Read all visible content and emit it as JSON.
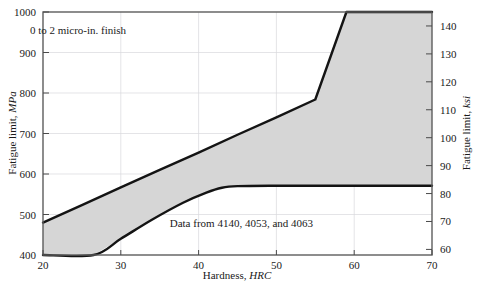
{
  "chart_data": {
    "type": "area",
    "title": "",
    "xlabel_prefix": "Hardness, ",
    "xlabel_unit": "HRC",
    "ylabel_prefix": "Fatigue limit, ",
    "ylabel_unit": "MPa",
    "ylabel_right_prefix": "Fatigue limit, ",
    "ylabel_right_unit": "ksi",
    "xlim": [
      20,
      70
    ],
    "ylim": [
      400,
      1000
    ],
    "ylim_right": [
      58,
      145
    ],
    "xticks": [
      20,
      30,
      40,
      50,
      60,
      70
    ],
    "yticks": [
      400,
      500,
      600,
      700,
      800,
      900,
      1000
    ],
    "yticks_right": [
      60,
      70,
      80,
      90,
      100,
      110,
      120,
      130,
      140
    ],
    "grid": true,
    "legend": "none",
    "band_color": "#d6d6d6",
    "edge_color": "#141414",
    "series": [
      {
        "name": "upper-bound",
        "description": "Upper bound of fatigue limit scatter band, linear rise clipped at 1000 MPa",
        "x": [
          20,
          25,
          30,
          35,
          40,
          45,
          50,
          55,
          59,
          65,
          70
        ],
        "values": [
          480,
          523,
          567,
          610,
          653,
          697,
          740,
          784,
          1000,
          1000,
          1000
        ]
      },
      {
        "name": "lower-bound",
        "description": "Lower bound of fatigue limit scatter band, rises then plateaus near 570 MPa",
        "x": [
          20,
          26.5,
          30,
          34,
          38,
          41,
          43,
          45,
          50,
          55,
          60,
          65,
          70
        ],
        "values": [
          400,
          400,
          440,
          487,
          529,
          554,
          566,
          570,
          571,
          571,
          571,
          571,
          571
        ]
      }
    ],
    "annotations": [
      {
        "name": "finish-note",
        "text": "0 to 2 micro-in. finish",
        "x": 24.5,
        "y": 945
      },
      {
        "name": "data-source-note",
        "text": "Data from 4140, 4053, and 4063",
        "x": 45.5,
        "y": 470
      }
    ]
  },
  "axes": {
    "x": {
      "label_prefix": "Hardness, ",
      "label_unit": "HRC",
      "tick_labels": [
        "20",
        "30",
        "40",
        "50",
        "60",
        "70"
      ]
    },
    "y_left": {
      "label_prefix": "Fatigue limit, ",
      "label_unit": "MPa",
      "tick_labels": [
        "400",
        "500",
        "600",
        "700",
        "800",
        "900",
        "1000"
      ]
    },
    "y_right": {
      "label_prefix": "Fatigue limit, ",
      "label_unit": "ksi",
      "tick_labels": [
        "60",
        "70",
        "80",
        "90",
        "100",
        "110",
        "120",
        "130",
        "140"
      ]
    }
  },
  "annotations": {
    "finish_note": "0 to 2 micro-in. finish",
    "data_source_note": "Data from 4140, 4053, and 4063"
  }
}
